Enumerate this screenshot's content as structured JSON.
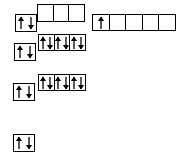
{
  "diagram": {
    "stroke_color": "#000000",
    "background_color": "#ffffff",
    "arrow_color": "#000000",
    "groups": [
      {
        "name": "group-row1-single-filled",
        "label": "s-orbital-paired",
        "x": 15,
        "y": 14,
        "box_width": 22,
        "box_height": 18,
        "boxes": [
          {
            "name": "orbital-box-paired",
            "electrons": [
              "up",
              "down"
            ]
          }
        ]
      },
      {
        "name": "group-row1-triple-empty",
        "label": "p-orbitals-empty",
        "x": 37,
        "y": 4,
        "box_width": 17,
        "box_height": 18,
        "boxes": [
          {
            "name": "orbital-box-empty",
            "electrons": []
          },
          {
            "name": "orbital-box-empty",
            "electrons": []
          },
          {
            "name": "orbital-box-empty",
            "electrons": []
          }
        ]
      },
      {
        "name": "group-row1-quintuple",
        "label": "d-orbitals-one-electron",
        "x": 92,
        "y": 14,
        "box_width": 18,
        "box_height": 17,
        "boxes": [
          {
            "name": "orbital-box-single",
            "electrons": [
              "up"
            ]
          },
          {
            "name": "orbital-box-empty",
            "electrons": []
          },
          {
            "name": "orbital-box-empty",
            "electrons": []
          },
          {
            "name": "orbital-box-empty",
            "electrons": []
          },
          {
            "name": "orbital-box-empty",
            "electrons": []
          }
        ]
      },
      {
        "name": "group-row2-triple-filled",
        "label": "p-orbitals-full",
        "x": 38,
        "y": 34,
        "box_width": 17,
        "box_height": 17,
        "boxes": [
          {
            "name": "orbital-box-paired",
            "electrons": [
              "up",
              "down"
            ]
          },
          {
            "name": "orbital-box-paired",
            "electrons": [
              "up",
              "down"
            ]
          },
          {
            "name": "orbital-box-paired",
            "electrons": [
              "up",
              "down"
            ]
          }
        ]
      },
      {
        "name": "group-row2-single-filled",
        "label": "s-orbital-paired",
        "x": 14,
        "y": 43,
        "box_width": 22,
        "box_height": 18,
        "boxes": [
          {
            "name": "orbital-box-paired",
            "electrons": [
              "up",
              "down"
            ]
          }
        ]
      },
      {
        "name": "group-row3-triple-filled",
        "label": "p-orbitals-full",
        "x": 38,
        "y": 74,
        "box_width": 17,
        "box_height": 17,
        "boxes": [
          {
            "name": "orbital-box-paired",
            "electrons": [
              "up",
              "down"
            ]
          },
          {
            "name": "orbital-box-paired",
            "electrons": [
              "up",
              "down"
            ]
          },
          {
            "name": "orbital-box-paired",
            "electrons": [
              "up",
              "down"
            ]
          }
        ]
      },
      {
        "name": "group-row3-single-filled",
        "label": "s-orbital-paired",
        "x": 13,
        "y": 83,
        "box_width": 22,
        "box_height": 18,
        "boxes": [
          {
            "name": "orbital-box-paired",
            "electrons": [
              "up",
              "down"
            ]
          }
        ]
      },
      {
        "name": "group-row4-single-filled",
        "label": "s-orbital-paired",
        "x": 13,
        "y": 134,
        "box_width": 22,
        "box_height": 18,
        "boxes": [
          {
            "name": "orbital-box-paired",
            "electrons": [
              "up",
              "down"
            ]
          }
        ]
      }
    ]
  }
}
